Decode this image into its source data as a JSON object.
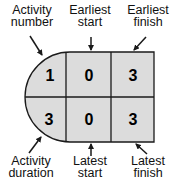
{
  "labels": {
    "activity_number": [
      "Activity",
      "number"
    ],
    "earliest_start": [
      "Earliest",
      "start"
    ],
    "earliest_finish": [
      "Earliest",
      "finish"
    ],
    "activity_duration": [
      "Activity",
      "duration"
    ],
    "latest_start": [
      "Latest",
      "start"
    ],
    "latest_finish": [
      "Latest",
      "finish"
    ]
  },
  "node": {
    "activity_number": "1",
    "earliest_start": "0",
    "earliest_finish": "3",
    "activity_duration": "3",
    "latest_start": "0",
    "latest_finish": "3"
  },
  "colors": {
    "fill": "#dcdcdc",
    "stroke": "#1a1a1a"
  }
}
